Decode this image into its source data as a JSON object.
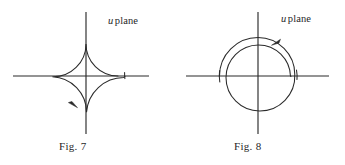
{
  "sheet": {
    "background_color": "#ffffff",
    "ink_color": "#2a2a2a",
    "width": 345,
    "height": 165
  },
  "figures": [
    {
      "id": "fig-7",
      "caption": "Fig. 7",
      "plane_label_symbol": "u",
      "plane_label_text": "plane",
      "center": {
        "x": 86,
        "y": 76
      },
      "inner_radius": 32,
      "outer_radius": 39,
      "gap_side": "positive-real-axis",
      "orientation": "clockwise",
      "arrow_position": "lower-left",
      "arrow_direction": "down-right",
      "axes": {
        "horizontal": {
          "x1": 13,
          "x2": 149,
          "y": 76
        },
        "vertical": {
          "y1": 12,
          "y2": 134,
          "x": 86
        }
      }
    },
    {
      "id": "fig-8",
      "caption": "Fig. 8",
      "plane_label_symbol": "u",
      "plane_label_text": "plane",
      "center": {
        "x": 258,
        "y": 76
      },
      "inner_radius": 32,
      "outer_radius": 39,
      "gap_side": "negative-real-axis",
      "orientation": "counterclockwise",
      "arrow_position": "top",
      "arrow_direction": "down-left",
      "axes": {
        "horizontal": {
          "x1": 186,
          "x2": 329,
          "y": 76
        },
        "vertical": {
          "y1": 12,
          "y2": 134,
          "x": 258
        }
      }
    }
  ]
}
